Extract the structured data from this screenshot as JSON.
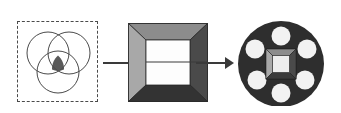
{
  "figure": {
    "background_color": "#ffffff",
    "width": 341,
    "height": 113
  },
  "stages": [
    {
      "id": "venn-stage",
      "name": "venn-diagram-in-dashed-box",
      "label": "",
      "border_style": "dashed",
      "border_color": "#4a4a4a",
      "fill_color": "#ffffff",
      "circle_stroke": "#4a4a4a",
      "intersection_fill": "#5a5a5a",
      "circle_count": 3,
      "circles": [
        {
          "name": "venn-circle-top-left",
          "cx": 30,
          "cy": 31,
          "r": 21
        },
        {
          "name": "venn-circle-top-right",
          "cx": 51,
          "cy": 31,
          "r": 21
        },
        {
          "name": "venn-circle-bottom",
          "cx": 40,
          "cy": 50,
          "r": 21
        }
      ]
    },
    {
      "id": "frame-stage",
      "name": "beveled-square-frame",
      "label": "",
      "face_top_color": "#8c8c8c",
      "face_left_color": "#a8a8a8",
      "face_right_color": "#4a4a4a",
      "face_bottom_color": "#333333",
      "opening_color": "#fdfdfd",
      "outline_color": "#2b2b2b",
      "bevel_depth_px": 17
    },
    {
      "id": "disc-stage",
      "name": "perforated-disc-with-center-boss",
      "label": "",
      "disc_color": "#2e2e2e",
      "hole_color": "#f2f2f2",
      "hole_count": 6,
      "holes": [
        {
          "name": "disc-hole-top",
          "cx": 44,
          "cy": 18,
          "r": 9.5
        },
        {
          "name": "disc-hole-upper-left",
          "cx": 20,
          "cy": 32,
          "r": 9.5
        },
        {
          "name": "disc-hole-upper-right",
          "cx": 68,
          "cy": 32,
          "r": 9.5
        },
        {
          "name": "disc-hole-lower-left",
          "cx": 20,
          "cy": 60,
          "r": 9.5
        },
        {
          "name": "disc-hole-lower-right",
          "cx": 68,
          "cy": 60,
          "r": 9.5
        },
        {
          "name": "disc-hole-bottom",
          "cx": 44,
          "cy": 74,
          "r": 9.5
        }
      ],
      "center_boss": {
        "name": "center-beveled-square",
        "face_top_color": "#8c8c8c",
        "face_left_color": "#a8a8a8",
        "face_right_color": "#4a4a4a",
        "face_bottom_color": "#3a3a3a",
        "opening_color": "#ededed",
        "outline_color": "#222222"
      }
    }
  ],
  "connectors": [
    {
      "name": "connector-venn-to-frame",
      "style": "plain-line",
      "color": "#3a3a3a",
      "has_arrowhead": false
    },
    {
      "name": "connector-frame-to-disc",
      "style": "arrow",
      "color": "#3a3a3a",
      "has_arrowhead": true
    }
  ]
}
